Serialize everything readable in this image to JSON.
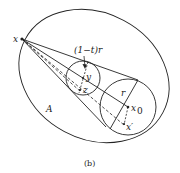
{
  "diagram": {
    "caption": "(b)",
    "labels": {
      "apex": "x",
      "region": "A",
      "small_radius": "(1−t)r",
      "y_point": "y",
      "z_point": "z",
      "large_radius": "r",
      "center": "x",
      "center_sub": "0",
      "x_prime": "x′"
    },
    "colors": {
      "stroke": "#222222",
      "background": "#ffffff"
    }
  }
}
